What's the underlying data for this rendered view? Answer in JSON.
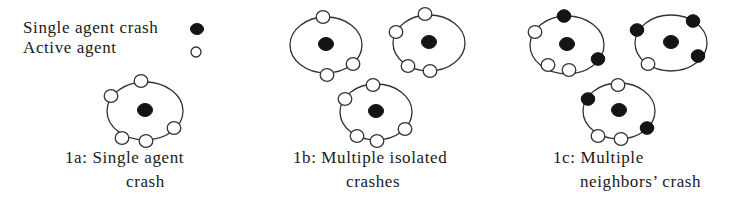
{
  "legend": {
    "items": [
      {
        "label": "Single agent crash",
        "symbol": "filled-circle",
        "x": 23,
        "y": 33,
        "sx": 197,
        "sy": 29
      },
      {
        "label": "Active agent",
        "symbol": "open-circle",
        "x": 23,
        "y": 53,
        "sx": 196,
        "sy": 52
      }
    ]
  },
  "colors": {
    "crash": "#141414",
    "active": "#ffffff",
    "stroke": "#333333"
  },
  "panels": [
    {
      "id": "1a",
      "caption_line1": "1a: Single agent",
      "caption_line2": "crash",
      "c1x": 65,
      "c2x": 126,
      "clusters": [
        {
          "cx": 145,
          "cy": 111,
          "rx": 38,
          "ry": 29,
          "center": "crash",
          "nodes": [
            [
              141,
              81,
              "active"
            ],
            [
              111,
              96,
              "active"
            ],
            [
              174,
              128,
              "active"
            ],
            [
              122,
              138,
              "active"
            ],
            [
              146,
              141,
              "active"
            ]
          ]
        }
      ]
    },
    {
      "id": "1b",
      "caption_line1": "1b: Multiple isolated",
      "caption_line2": "crashes",
      "c1x": 293,
      "c2x": 346,
      "clusters": [
        {
          "cx": 326,
          "cy": 45,
          "rx": 36,
          "ry": 28,
          "center": "crash",
          "nodes": [
            [
              323,
              17,
              "active"
            ],
            [
              353,
              64,
              "active"
            ],
            [
              327,
              75,
              "active"
            ]
          ]
        },
        {
          "cx": 429,
          "cy": 43,
          "rx": 36,
          "ry": 28,
          "center": "crash",
          "nodes": [
            [
              425,
              14,
              "active"
            ],
            [
              396,
              32,
              "active"
            ],
            [
              408,
              66,
              "active"
            ],
            [
              430,
              71,
              "active"
            ]
          ]
        },
        {
          "cx": 376,
          "cy": 112,
          "rx": 36,
          "ry": 28,
          "center": "crash",
          "nodes": [
            [
              373,
              85,
              "active"
            ],
            [
              345,
              99,
              "active"
            ],
            [
              357,
              136,
              "active"
            ],
            [
              377,
              141,
              "active"
            ],
            [
              405,
              129,
              "active"
            ]
          ]
        }
      ]
    },
    {
      "id": "1c",
      "caption_line1": "1c: Multiple",
      "caption_line2": "neighbors’ crash",
      "c1x": 553,
      "c2x": 580,
      "clusters": [
        {
          "cx": 567,
          "cy": 45,
          "rx": 37,
          "ry": 29,
          "center": "crash",
          "nodes": [
            [
              564,
              16,
              "crash"
            ],
            [
              535,
              32,
              "active"
            ],
            [
              598,
              59,
              "crash"
            ],
            [
              548,
              65,
              "active"
            ],
            [
              569,
              70,
              "active"
            ]
          ]
        },
        {
          "cx": 671,
          "cy": 43,
          "rx": 36,
          "ry": 28,
          "center": "crash",
          "nodes": [
            [
              637,
              30,
              "crash"
            ],
            [
              693,
              21,
              "crash"
            ],
            [
              698,
              56,
              "crash"
            ],
            [
              648,
              64,
              "active"
            ]
          ]
        },
        {
          "cx": 619,
          "cy": 111,
          "rx": 36,
          "ry": 28,
          "center": "crash",
          "nodes": [
            [
              618,
              85,
              "active"
            ],
            [
              588,
              99,
              "crash"
            ],
            [
              647,
              128,
              "crash"
            ],
            [
              598,
              136,
              "active"
            ],
            [
              621,
              139,
              "active"
            ]
          ]
        }
      ]
    }
  ]
}
